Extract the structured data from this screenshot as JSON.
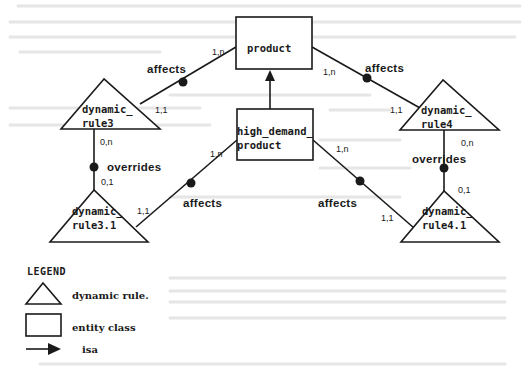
{
  "diagram": {
    "type": "entity-relationship diagram with dynamic rules",
    "entities": [
      {
        "id": "product",
        "label": "product",
        "shape": "rectangle"
      },
      {
        "id": "high_demand_product",
        "label_line1": "high_demand_",
        "label_line2": "product",
        "shape": "rectangle"
      }
    ],
    "dynamic_rules": [
      {
        "id": "dynamic_rule3",
        "label_line1": "dynamic_",
        "label_line2": "rule3",
        "shape": "triangle"
      },
      {
        "id": "dynamic_rule4",
        "label_line1": "dynamic_",
        "label_line2": "rule4",
        "shape": "triangle"
      },
      {
        "id": "dynamic_rule3_1",
        "label_line1": "dynamic_",
        "label_line2": "rule3.1",
        "shape": "triangle"
      },
      {
        "id": "dynamic_rule4_1",
        "label_line1": "dynamic_",
        "label_line2": "rule4.1",
        "shape": "triangle"
      }
    ],
    "relationships": [
      {
        "from": "dynamic_rule3",
        "to": "product",
        "label": "affects",
        "card_from": "1,1",
        "card_to": "1,n"
      },
      {
        "from": "dynamic_rule4",
        "to": "product",
        "label": "affects",
        "card_from": "1,1",
        "card_to": "1,n"
      },
      {
        "from": "dynamic_rule3_1",
        "to": "high_demand_product",
        "label": "affects",
        "card_from": "1,1",
        "card_to": "1,n"
      },
      {
        "from": "dynamic_rule4_1",
        "to": "high_demand_product",
        "label": "affects",
        "card_from": "1,1",
        "card_to": "1,n"
      },
      {
        "from": "dynamic_rule3_1",
        "to": "dynamic_rule3",
        "label": "overrides",
        "card_from": "0,1",
        "card_to": "0,n"
      },
      {
        "from": "dynamic_rule4_1",
        "to": "dynamic_rule4",
        "label": "overrides",
        "card_from": "0,1",
        "card_to": "0,n"
      }
    ],
    "isa": [
      {
        "from": "high_demand_product",
        "to": "product"
      }
    ]
  },
  "legend": {
    "title": "LEGEND",
    "items": [
      {
        "symbol": "triangle",
        "label": "dynamic rule."
      },
      {
        "symbol": "rectangle",
        "label": "entity class"
      },
      {
        "symbol": "arrow",
        "label": "isa"
      }
    ]
  },
  "colors": {
    "ink": "#1a1a1a",
    "background": "#ffffff",
    "bleed_through": "#e6e6e6"
  }
}
